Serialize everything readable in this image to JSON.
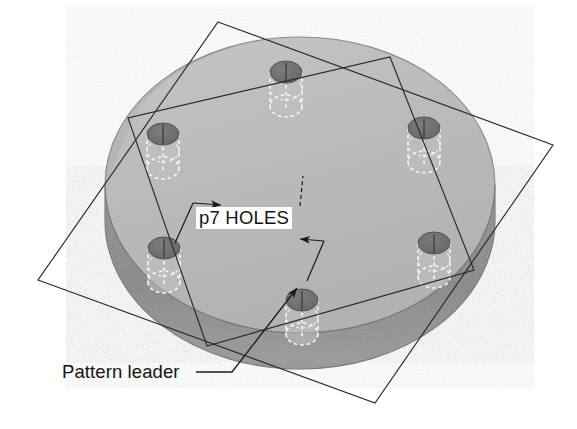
{
  "figure": {
    "view": "isometric",
    "background_color": "#ffffff"
  },
  "annotations": {
    "hole_count_label": "p7 HOLES",
    "pattern_leader_label": "Pattern leader"
  },
  "colors": {
    "plate_top_face": "#b9b9b9",
    "plate_top_face_highlight": "#c4c4c4",
    "plate_rim_side": "#8d8d8d",
    "plate_outline": "#6f6f6f",
    "hole_bore_dark": "#6e6e6e",
    "hole_hidden_edge": "#f2f2f2",
    "construction_line": "#2a2a2a",
    "dimension_line": "#1a1a1a",
    "text": "#141414"
  },
  "plate": {
    "shape": "disc",
    "center_x": 300,
    "center_y": 185,
    "radius_x": 195,
    "radius_y": 148,
    "thickness_px": 36
  },
  "holes": [
    {
      "id": "hole-1",
      "cx": 286,
      "cy": 72,
      "label_position": "top"
    },
    {
      "id": "hole-2",
      "cx": 424,
      "cy": 128,
      "label_position": "upper-right"
    },
    {
      "id": "hole-3",
      "cx": 434,
      "cy": 243,
      "label_position": "lower-right"
    },
    {
      "id": "hole-4",
      "cx": 302,
      "cy": 300,
      "label_position": "bottom"
    },
    {
      "id": "hole-5",
      "cx": 164,
      "cy": 248,
      "label_position": "lower-left"
    },
    {
      "id": "hole-6",
      "cx": 163,
      "cy": 134,
      "label_position": "upper-left"
    }
  ],
  "hole_geometry": {
    "top_ellipse_rx": 16,
    "top_ellipse_ry": 11,
    "bore_depth_px": 40
  },
  "construction_planes": [
    {
      "id": "outer-plane",
      "corners": [
        {
          "x": 218,
          "y": 22
        },
        {
          "x": 553,
          "y": 145
        },
        {
          "x": 375,
          "y": 403
        },
        {
          "x": 38,
          "y": 280
        }
      ]
    },
    {
      "id": "inner-plane",
      "corners": [
        {
          "x": 390,
          "y": 57
        },
        {
          "x": 474,
          "y": 270
        },
        {
          "x": 207,
          "y": 346
        },
        {
          "x": 128,
          "y": 118
        }
      ]
    }
  ],
  "dimension_markers": [
    {
      "id": "left-witness",
      "x1": 193,
      "y1": 203,
      "x2": 175,
      "y2": 243,
      "arrow_at": "start",
      "arrow_dir": "right"
    },
    {
      "id": "right-witness",
      "x1": 324,
      "y1": 241,
      "x2": 307,
      "y2": 281,
      "arrow_at": "start",
      "arrow_dir": "left"
    }
  ],
  "leader": {
    "id": "pattern-leader-line",
    "text_anchor": {
      "x": 196,
      "y": 372
    },
    "elbow": {
      "x": 232,
      "y": 372
    },
    "tip": {
      "x": 297,
      "y": 288
    }
  }
}
